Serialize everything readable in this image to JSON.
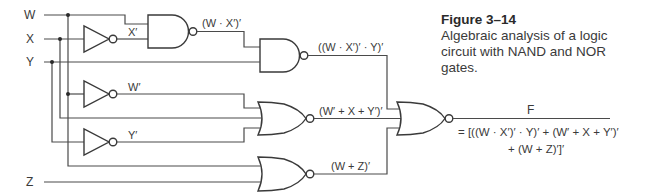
{
  "caption": {
    "figure_number": "Figure 3–14",
    "line1": "Algebraic analysis of a logic",
    "line2": "circuit with NAND and NOR gates."
  },
  "inputs": {
    "w": "W",
    "x": "X",
    "y": "Y",
    "z": "Z"
  },
  "signals": {
    "x_not": "X′",
    "w_not": "W′",
    "y_not": "Y′",
    "nand1_out": "(W · X′)′",
    "nand2_out": "((W · X′)′ · Y)′",
    "nor1_out": "(W′ + X + Y′)′",
    "nor2_out": "(W + Z)′"
  },
  "output": {
    "name": "F",
    "equation_line1": "= [((W · X′)′ · Y)′ + (W′ + X + Y′)′",
    "equation_line2": "+ (W + Z)′]′"
  },
  "colors": {
    "line": "#4a4a4a",
    "text": "#3a3a3a",
    "background": "#ffffff"
  }
}
